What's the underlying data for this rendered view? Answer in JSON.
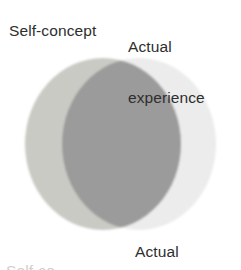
{
  "figure": {
    "type": "venn-two-circle"
  },
  "labels": {
    "left_circle": "Self-concept",
    "right_circle_line1": "Actual",
    "right_circle_line2": "experience",
    "bottom_caption": "Actual",
    "bottom_cut_text": "Self-co"
  },
  "colors": {
    "background": "#ffffff",
    "left_circle": "#c9cac4",
    "right_circle": "#ececec",
    "overlap": "#9b9b9b",
    "text": "#2e2e2e",
    "cut_text": "#cfcfcf"
  },
  "geometry": {
    "left_circle": {
      "cx": 103,
      "cy": 144,
      "rx": 78,
      "ry": 86
    },
    "right_circle": {
      "cx": 139,
      "cy": 144,
      "rx": 77,
      "ry": 86
    },
    "overlap_left_edge": 62,
    "overlap_right_edge": 182,
    "diagram_top": 58,
    "diagram_bottom": 230
  },
  "chart_data": {
    "type": "venn",
    "sets": [
      {
        "name": "Self-concept",
        "label_position": "top-left",
        "fill": "#c9cac4"
      },
      {
        "name": "Actual experience",
        "label_position": "top-right",
        "fill": "#ececec"
      }
    ],
    "intersection": {
      "name": "Congruence",
      "fill": "#9b9b9b",
      "relative_size": "large"
    },
    "annotations": [
      "Actual"
    ],
    "grid": false,
    "legend": "none"
  }
}
